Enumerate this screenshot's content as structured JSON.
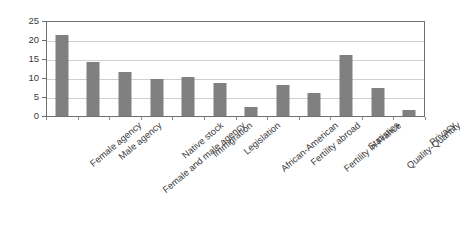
{
  "chart_data": {
    "type": "bar",
    "title": "",
    "xlabel": "",
    "ylabel": "",
    "ylim": [
      0,
      25
    ],
    "yticks": [
      0,
      5,
      10,
      15,
      20,
      25
    ],
    "grid": true,
    "legend": "none",
    "bar_color": "#808080",
    "axis_color": "#6e6e6e",
    "gridline_color": "#cfcfcf",
    "categories": [
      "Female agency",
      "Male agency",
      "Female and male agency",
      "Native stock",
      "Immigration",
      "Legislation",
      "African-American",
      "Fertility abroad",
      "Fertility in France",
      "Statistics",
      "Quality-Quantity",
      "Privacy"
    ],
    "values": [
      21.2,
      14.2,
      11.5,
      9.7,
      10.3,
      8.8,
      2.4,
      8.2,
      6.0,
      16.0,
      7.4,
      1.7
    ]
  }
}
